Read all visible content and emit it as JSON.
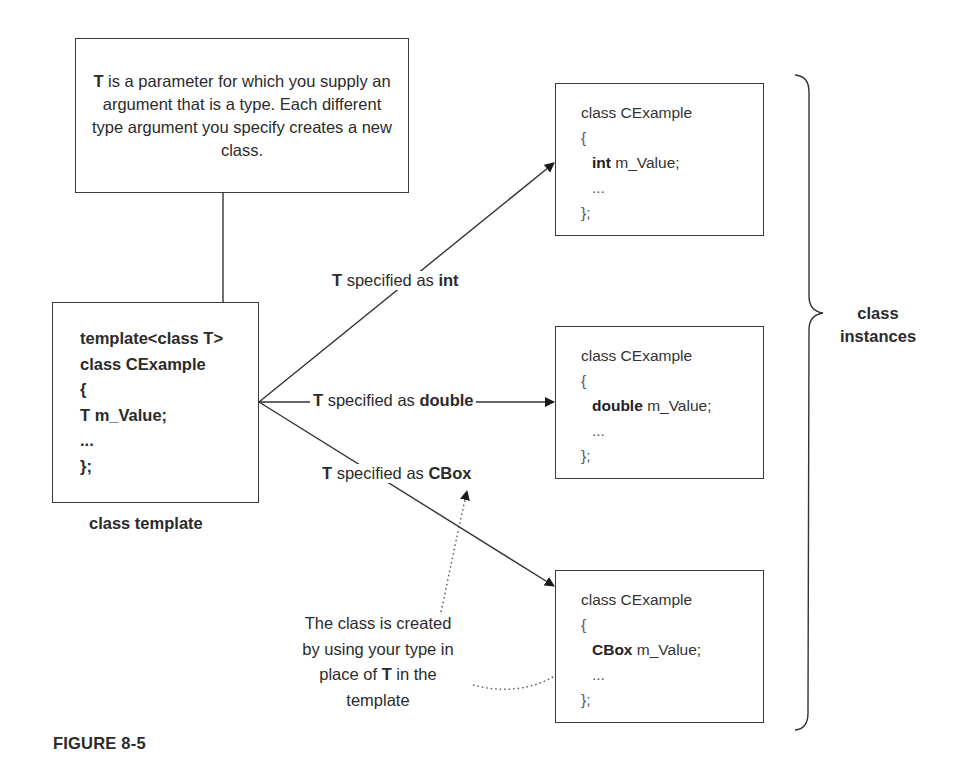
{
  "figure_label": "FIGURE 8-5",
  "note_box": {
    "bold_prefix": "T",
    "text": " is a parameter for which you supply an argument that is a type. Each different type argument you specify creates a new class."
  },
  "template_box": {
    "lines": [
      "template<class T>",
      "class CExample",
      "{",
      "T m_Value;",
      "...",
      "};"
    ],
    "caption": "class template"
  },
  "instances": [
    {
      "type": "int",
      "lines": [
        "class CExample",
        "{",
        "m_Value;",
        "...",
        "};"
      ]
    },
    {
      "type": "double",
      "lines": [
        "class CExample",
        "{",
        "m_Value;",
        "...",
        "};"
      ]
    },
    {
      "type": "CBox",
      "lines": [
        "class CExample",
        "{",
        "m_Value;",
        "...",
        "};"
      ]
    }
  ],
  "arrow_labels": [
    {
      "bold_prefix": "T",
      "text": " specified as ",
      "bold_suffix": "int"
    },
    {
      "bold_prefix": "T",
      "text": " specified as ",
      "bold_suffix": "double"
    },
    {
      "bold_prefix": "T",
      "text": " specified as ",
      "bold_suffix": "CBox"
    }
  ],
  "brace_label": {
    "line1": "class",
    "line2": "instances"
  },
  "explanation": {
    "line1": "The class is created",
    "line2": "by using your type in",
    "line3_pre": "place of ",
    "line3_bold": "T",
    "line3_post": " in the",
    "line4": "template"
  }
}
